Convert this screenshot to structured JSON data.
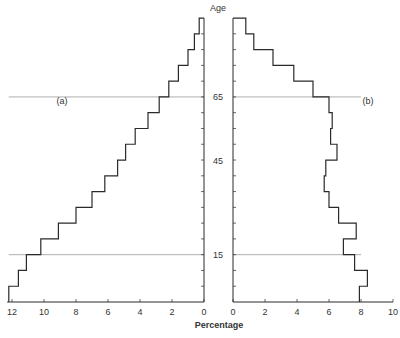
{
  "chart_data": {
    "type": "bar",
    "subtype": "population-pyramid-step",
    "title": "",
    "xlabel": "Percentage",
    "ylabel": "Age",
    "age_bands": [
      "0-5",
      "5-10",
      "10-15",
      "15-20",
      "20-25",
      "25-30",
      "30-35",
      "35-40",
      "40-45",
      "45-50",
      "50-55",
      "55-60",
      "60-65",
      "65-70",
      "70-75",
      "75-80",
      "80-85",
      "85-90"
    ],
    "y_tick_labels": [
      "15",
      "45",
      "65"
    ],
    "y_ticks": [
      15,
      45,
      65
    ],
    "ylim": [
      0,
      90
    ],
    "reference_lines": [
      15,
      65
    ],
    "series": [
      {
        "name": "(a)",
        "side": "left",
        "xlim": [
          12,
          0
        ],
        "x_tick_labels": [
          "12",
          "10",
          "8",
          "6",
          "4",
          "2",
          "0"
        ],
        "values": [
          12.2,
          11.6,
          11.1,
          10.2,
          9.1,
          8.0,
          7.0,
          6.2,
          5.4,
          4.9,
          4.3,
          3.5,
          2.8,
          2.2,
          1.6,
          1.0,
          0.6,
          0.3
        ]
      },
      {
        "name": "(b)",
        "side": "right",
        "xlim": [
          0,
          10
        ],
        "x_tick_labels": [
          "0",
          "2",
          "4",
          "6",
          "8",
          "10"
        ],
        "values": [
          7.9,
          8.4,
          7.6,
          6.9,
          7.7,
          6.6,
          6.0,
          5.7,
          5.8,
          6.5,
          6.1,
          6.2,
          6.0,
          5.0,
          3.8,
          2.5,
          1.3,
          0.8
        ]
      }
    ],
    "grid": false,
    "legend": "none; panels labelled (a) and (b)"
  },
  "labels": {
    "panel_a": "(a)",
    "panel_b": "(b)",
    "age_axis": "Age",
    "x_axis": "Percentage"
  },
  "style": {
    "line_color": "#2a2a2a",
    "ref_line_color": "#9a9a9a",
    "background": "#ffffff"
  }
}
